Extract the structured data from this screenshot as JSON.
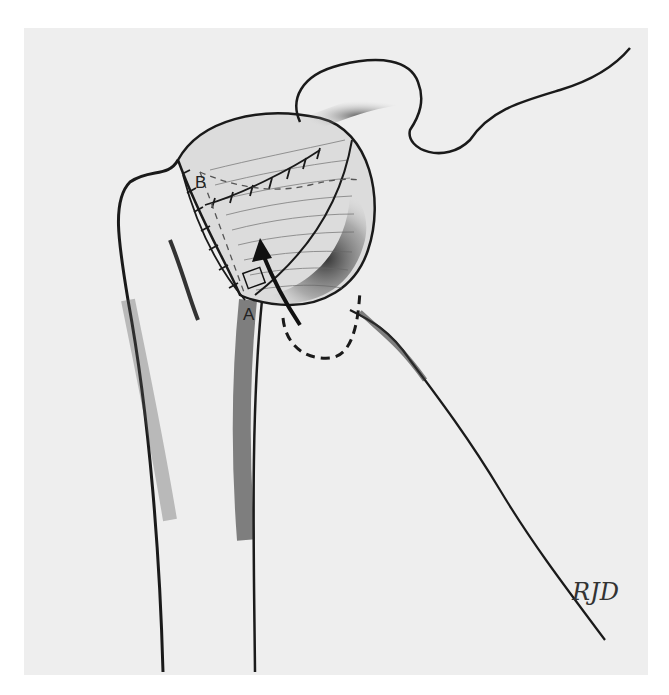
{
  "illustration": {
    "subject": "Shoulder joint — humeral head with rotator cuff tendon transfer repair",
    "labels": [
      {
        "id": "B",
        "text": "B"
      },
      {
        "id": "A",
        "text": "A"
      }
    ],
    "signature": "RJD",
    "colors": {
      "background": "#eeeeee",
      "page": "#ffffff",
      "ink": "#1a1a1a",
      "shade": "#555555"
    }
  }
}
